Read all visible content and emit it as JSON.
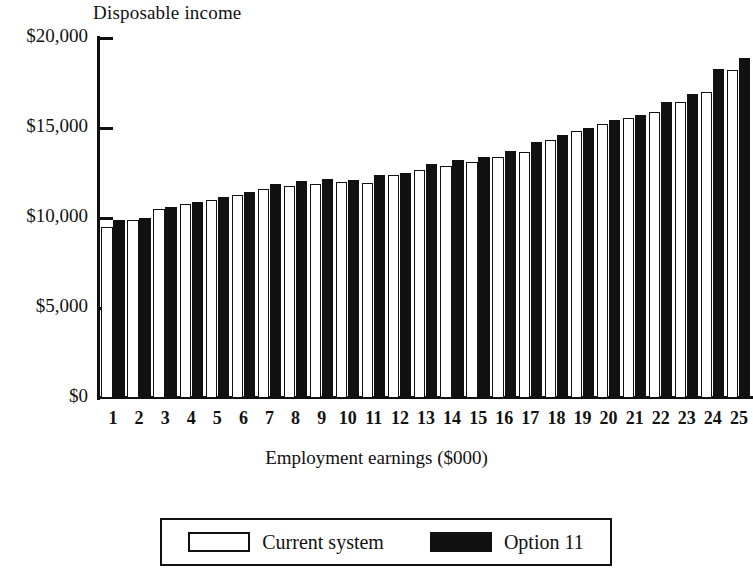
{
  "chart_data": {
    "type": "bar",
    "title": "Disposable income",
    "ytitle": "Disposable income",
    "xlabel": "Employment earnings ($000)",
    "ylabel": "Disposable income",
    "ylim": [
      0,
      20000
    ],
    "yticks": [
      0,
      5000,
      10000,
      15000,
      20000
    ],
    "ytick_labels": [
      "$0",
      "$5,000",
      "$10,000",
      "$15,000",
      "$20,000"
    ],
    "grid": false,
    "legend_position": "bottom",
    "categories": [
      "1",
      "2",
      "3",
      "4",
      "5",
      "6",
      "7",
      "8",
      "9",
      "10",
      "11",
      "12",
      "13",
      "14",
      "15",
      "16",
      "17",
      "18",
      "19",
      "20",
      "21",
      "22",
      "23",
      "24",
      "25"
    ],
    "series": [
      {
        "name": "Current system",
        "color": "#ffffff",
        "edge_color": "#111111",
        "values": [
          9500,
          9900,
          10500,
          10800,
          11000,
          11300,
          11600,
          11800,
          11900,
          12000,
          11950,
          12400,
          12650,
          12900,
          13100,
          13400,
          13650,
          14350,
          14850,
          15250,
          15550,
          15900,
          16450,
          17000,
          18250
        ]
      },
      {
        "name": "Option 11",
        "color": "#111111",
        "edge_color": "#111111",
        "values": [
          9900,
          10000,
          10600,
          10900,
          11150,
          11450,
          11900,
          12050,
          12150,
          12100,
          12400,
          12500,
          13000,
          13250,
          13400,
          13750,
          14250,
          14600,
          15000,
          15450,
          15750,
          16450,
          16900,
          18300,
          18900
        ]
      }
    ]
  },
  "legend": {
    "items": [
      {
        "label": "Current system",
        "swatch": "white-outline-swatch"
      },
      {
        "label": "Option 11",
        "swatch": "black-filled-swatch"
      }
    ]
  }
}
